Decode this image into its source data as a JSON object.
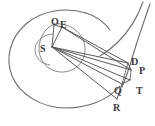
{
  "figure": {
    "background_color": "#ffffff",
    "stroke_color": "#5a5a5a",
    "label_color": "#3a3a3a",
    "width": 155,
    "height": 126
  },
  "labels": [
    {
      "id": "O",
      "text": "O",
      "x": 51,
      "y": 17
    },
    {
      "id": "E",
      "text": "E",
      "x": 60,
      "y": 20
    },
    {
      "id": "S",
      "text": "S",
      "x": 40,
      "y": 44
    },
    {
      "id": "D",
      "text": "D",
      "x": 131,
      "y": 57
    },
    {
      "id": "P",
      "text": "P",
      "x": 139,
      "y": 66
    },
    {
      "id": "T",
      "text": "T",
      "x": 136,
      "y": 86
    },
    {
      "id": "Q",
      "text": "Q",
      "x": 114,
      "y": 86
    },
    {
      "id": "R",
      "text": "R",
      "x": 113,
      "y": 103
    }
  ],
  "curves": {
    "outer_spiral": "large spiral arc enclosing the figure",
    "inner_circle": "small arc around point S",
    "mid_circle": "circle through O, E and the fan vertex",
    "right_arc": "steep arc descending through D, P, T"
  },
  "points": {
    "S": {
      "x": 52,
      "y": 47
    },
    "O": {
      "x": 54,
      "y": 26
    },
    "E": {
      "x": 62,
      "y": 28
    },
    "D": {
      "x": 128,
      "y": 64
    },
    "P": {
      "x": 131,
      "y": 70
    },
    "T": {
      "x": 130,
      "y": 80
    },
    "Q": {
      "x": 122,
      "y": 84
    },
    "R": {
      "x": 117,
      "y": 99
    }
  }
}
